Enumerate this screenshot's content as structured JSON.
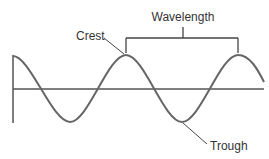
{
  "diagram": {
    "labels": {
      "crest": "Crest",
      "trough": "Trough",
      "wavelength": "Wavelength"
    },
    "colors": {
      "wave": "#666666",
      "axis": "#555555",
      "text": "#333333",
      "background": "#ffffff"
    }
  }
}
